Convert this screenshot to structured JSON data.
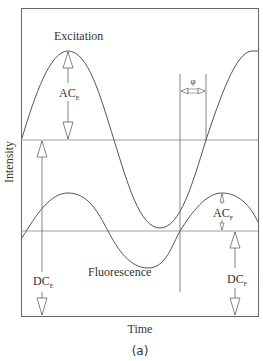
{
  "figure": {
    "caption": "(a)",
    "xlabel": "Time",
    "ylabel": "Intensity",
    "curves": {
      "excitation": {
        "label": "Excitation"
      },
      "fluorescence": {
        "label": "Fluorescence"
      }
    },
    "annotations": {
      "ac_excitation": {
        "main": "AC",
        "sub": "E"
      },
      "dc_excitation": {
        "main": "DC",
        "sub": "E"
      },
      "ac_fluorescence": {
        "main": "AC",
        "sub": "F"
      },
      "dc_fluorescence": {
        "main": "DC",
        "sub": "F"
      },
      "phase": "φ"
    },
    "colors": {
      "line": "#555555",
      "text": "#333333"
    }
  }
}
